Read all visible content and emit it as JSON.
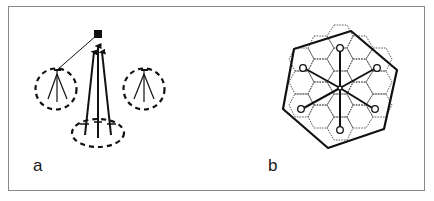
{
  "figure": {
    "panels": [
      {
        "id": "a",
        "label": "a",
        "description": "Three tripod stations (dashed circles) each connected to a single receiver node; central station sends three arrows upward",
        "elements": {
          "target_node": "filled-square",
          "stations": [
            "left-dashed-circle",
            "right-dashed-circle",
            "bottom-dashed-ellipse"
          ],
          "arrows_count": 3
        }
      },
      {
        "id": "b",
        "label": "b",
        "description": "Hexagonal cell tiling (dotted) with a bold outer boundary polygon; six spokes radiate from the center to small circle nodes",
        "elements": {
          "spokes_count": 6,
          "outer_boundary": "bold-hexagon",
          "cell_tiling": "dotted-hexagons"
        }
      }
    ]
  },
  "colors": {
    "ink": "#111111",
    "frame": "#8a8a8a",
    "dotted": "#666666",
    "background": "#ffffff"
  }
}
